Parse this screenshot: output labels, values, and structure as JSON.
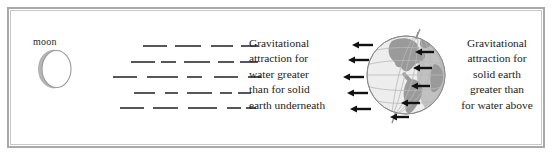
{
  "figure": {
    "width": 554,
    "height": 165,
    "background": "#ffffff",
    "frame_color": "#a9a9a9",
    "frame_inner_color": "#c8c8c8"
  },
  "moon": {
    "label": "moon",
    "disc_fill": "#ffffff",
    "disc_stroke": "#9a9a9a",
    "shadow_fill": "#b6b6b6"
  },
  "force_lines": {
    "color": "#56565c",
    "row_count": 5,
    "rows": [
      {
        "y": 45,
        "segments": [
          [
            143,
            24
          ],
          [
            175,
            26
          ],
          [
            211,
            22
          ],
          [
            241,
            17
          ]
        ]
      },
      {
        "y": 61,
        "segments": [
          [
            131,
            24
          ],
          [
            161,
            15
          ],
          [
            184,
            26
          ],
          [
            218,
            16
          ],
          [
            240,
            18
          ]
        ]
      },
      {
        "y": 76,
        "segments": [
          [
            113,
            24
          ],
          [
            147,
            31
          ],
          [
            187,
            15
          ],
          [
            214,
            24
          ],
          [
            248,
            13
          ]
        ]
      },
      {
        "y": 92,
        "segments": [
          [
            134,
            21
          ],
          [
            165,
            13
          ],
          [
            187,
            25
          ],
          [
            220,
            12
          ],
          [
            238,
            13
          ]
        ]
      },
      {
        "y": 107,
        "segments": [
          [
            120,
            24
          ],
          [
            153,
            25
          ],
          [
            188,
            29
          ],
          [
            227,
            14
          ],
          [
            246,
            10
          ]
        ]
      }
    ]
  },
  "caption_left": {
    "lines": [
      "Gravitational",
      "attraction for",
      "water greater",
      "than for solid",
      "earth underneath"
    ]
  },
  "caption_right": {
    "lines": [
      "Gravitational",
      "attraction for",
      "solid earth",
      "greater than",
      "for water above"
    ]
  },
  "earth": {
    "label": "earth-globe",
    "ocean_fill": "#ededed",
    "land_fill": "#9a9a9a",
    "limb_shadow_fill": "#b8b8b8",
    "grid_color": "#b9b9b9",
    "outline_color": "#8d8d8d",
    "axis_color": "#8d8d8d"
  },
  "arrows": {
    "color": "#111111",
    "outer_label": "water-arrow",
    "inner_label": "solid-earth-arrow",
    "outer": [
      {
        "x": 352,
        "y": 45,
        "len": 21
      },
      {
        "x": 348,
        "y": 60,
        "len": 21
      },
      {
        "x": 343,
        "y": 77,
        "len": 21
      },
      {
        "x": 347,
        "y": 93,
        "len": 21
      },
      {
        "x": 350,
        "y": 109,
        "len": 21
      }
    ],
    "inner": [
      {
        "x": 415,
        "y": 52,
        "len": 19
      },
      {
        "x": 413,
        "y": 68,
        "len": 19
      },
      {
        "x": 411,
        "y": 86,
        "len": 19
      },
      {
        "x": 401,
        "y": 103,
        "len": 19
      },
      {
        "x": 390,
        "y": 117,
        "len": 19
      }
    ]
  }
}
